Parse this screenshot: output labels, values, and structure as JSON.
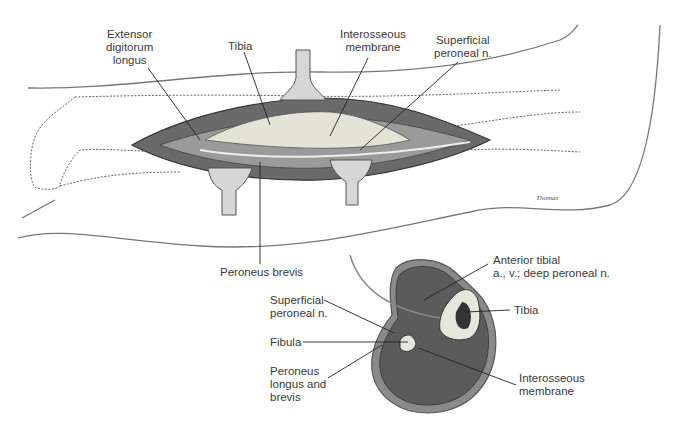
{
  "figure": {
    "colors": {
      "outline": "#555555",
      "muscle": "#5b5b5b",
      "bone": "#e6e6dc",
      "skin": "#ffffff",
      "label_text": "#3a3a3a"
    },
    "top_view": {
      "labels": [
        {
          "id": "extensor",
          "lines": [
            "Extensor",
            "digitorum",
            "longus"
          ]
        },
        {
          "id": "tibia",
          "lines": [
            "Tibia"
          ]
        },
        {
          "id": "interosseous",
          "lines": [
            "Interosseous",
            "membrane"
          ]
        },
        {
          "id": "superficial",
          "lines": [
            "Superficial",
            "peroneal n."
          ]
        },
        {
          "id": "peroneus_brevis",
          "lines": [
            "Peroneus brevis"
          ]
        }
      ]
    },
    "cross_section": {
      "labels": [
        {
          "id": "anterior_tibial",
          "lines": [
            "Anterior tibial",
            "a., v.; deep peroneal n."
          ]
        },
        {
          "id": "tibia",
          "lines": [
            "Tibia"
          ]
        },
        {
          "id": "superficial",
          "lines": [
            "Superficial",
            "peroneal n."
          ]
        },
        {
          "id": "fibula",
          "lines": [
            "Fibula"
          ]
        },
        {
          "id": "peroneus_lb",
          "lines": [
            "Peroneus",
            "longus and",
            "brevis"
          ]
        },
        {
          "id": "interosseous",
          "lines": [
            "Interosseous",
            "membrane"
          ]
        }
      ]
    },
    "signature": "Thomas"
  }
}
